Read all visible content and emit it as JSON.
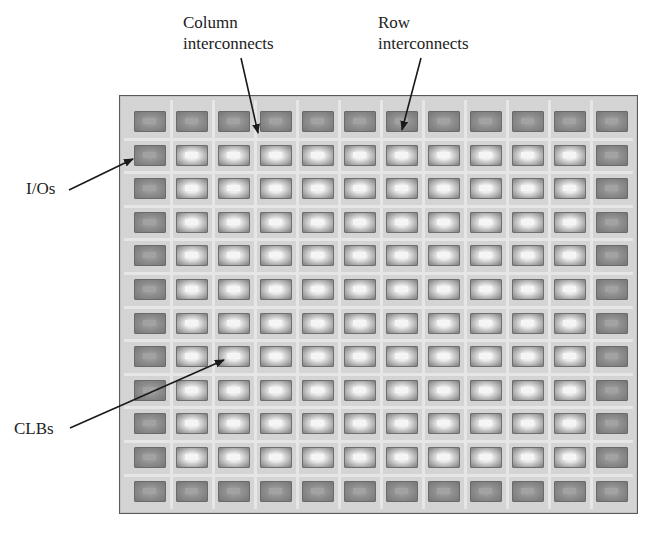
{
  "diagram": {
    "labels": {
      "column_interconnects": [
        "Column",
        "interconnects"
      ],
      "row_interconnects": [
        "Row",
        "interconnects"
      ],
      "ios": "I/Os",
      "clbs": "CLBs"
    },
    "grid": {
      "rows": 12,
      "cols": 12,
      "perimeter_type": "io",
      "interior_type": "clb"
    },
    "colors": {
      "board": "#d4d4d4",
      "board_border": "#5a5a5a",
      "interconnect": "#e6e6e6",
      "io_block": "#8f8f8f",
      "clb_block": "#ececec",
      "arrow": "#1a1a1a"
    },
    "arrows": [
      {
        "name": "column-interconnects-arrow",
        "from": [
          241,
          58
        ],
        "to": [
          258,
          133
        ]
      },
      {
        "name": "row-interconnects-arrow",
        "from": [
          421,
          58
        ],
        "to": [
          402,
          130
        ]
      },
      {
        "name": "ios-arrow",
        "from": [
          69,
          190
        ],
        "to": [
          133,
          159
        ]
      },
      {
        "name": "clbs-arrow",
        "from": [
          70,
          428
        ],
        "to": [
          224,
          360
        ]
      }
    ]
  }
}
